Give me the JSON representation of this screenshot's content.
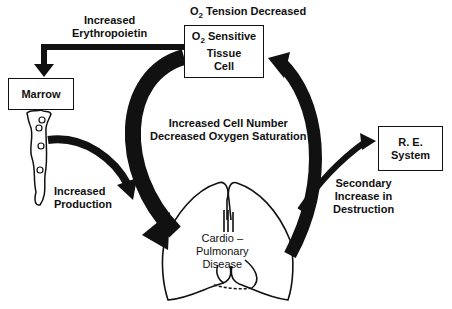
{
  "diagram": {
    "type": "feedback-cycle",
    "nodes": {
      "top_label": {
        "o2": "O",
        "sub": "2",
        "rest": " Tension Decreased"
      },
      "sensor": {
        "line1_o": "O",
        "line1_sub": "2",
        "line1_rest": " Sensitive",
        "line2": "Tissue",
        "line3": "Cell"
      },
      "marrow": {
        "label": "Marrow"
      },
      "re_system": {
        "line1": "R. E.",
        "line2": "System"
      },
      "lungs": {
        "line1": "Cardio –",
        "line2": "Pulmonary",
        "line3": "Disease"
      }
    },
    "edges": {
      "erythropoietin": {
        "line1": "Increased",
        "line2": "Erythropoietin"
      },
      "production": {
        "line1": "Increased",
        "line2": "Production"
      },
      "center": {
        "line1": "Increased Cell Number",
        "line2": "Decreased Oxygen Saturation"
      },
      "destruction": {
        "line1": "Secondary",
        "line2": "Increase  in",
        "line3": "Destruction"
      }
    },
    "colors": {
      "ink": "#111111",
      "background": "#ffffff"
    }
  }
}
